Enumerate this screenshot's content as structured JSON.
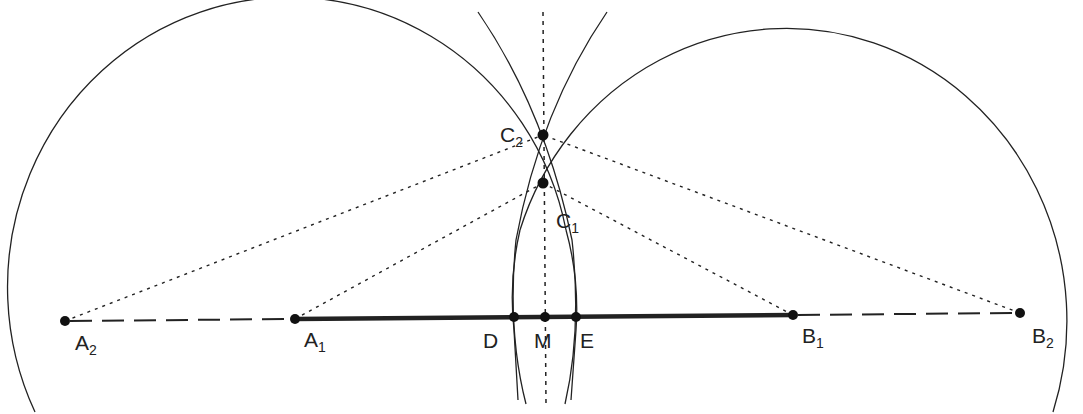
{
  "diagram": {
    "title": "",
    "colors": {
      "ink": "#222222",
      "background": "#ffffff"
    },
    "points": {
      "A2": {
        "label": "A",
        "sub": "2",
        "x": 65,
        "y": 321
      },
      "A1": {
        "label": "A",
        "sub": "1",
        "x": 295,
        "y": 319
      },
      "D": {
        "label": "D",
        "sub": "",
        "x": 514,
        "y": 317
      },
      "M": {
        "label": "M",
        "sub": "",
        "x": 545,
        "y": 317
      },
      "E": {
        "label": "E",
        "sub": "",
        "x": 576,
        "y": 317
      },
      "B1": {
        "label": "B",
        "sub": "1",
        "x": 793,
        "y": 315
      },
      "B2": {
        "label": "B",
        "sub": "2",
        "x": 1020,
        "y": 313
      },
      "C2": {
        "label": "C",
        "sub": "2",
        "x": 543,
        "y": 135
      },
      "C1": {
        "label": "C",
        "sub": "1",
        "x": 543,
        "y": 183
      }
    },
    "segments": [
      {
        "from": "A1",
        "to": "B1",
        "style": "bold"
      },
      {
        "from": "A2",
        "to": "A1",
        "style": "dashed"
      },
      {
        "from": "B1",
        "to": "B2",
        "style": "dashed"
      },
      {
        "from": "A2",
        "to": "C2",
        "style": "dotted"
      },
      {
        "from": "B2",
        "to": "C2",
        "style": "dotted"
      },
      {
        "from": "A1",
        "to": "C1",
        "style": "dotted"
      },
      {
        "from": "B1",
        "to": "C1",
        "style": "dotted"
      },
      {
        "name": "perpendicular-bisector",
        "style": "dotted"
      }
    ],
    "circles": [
      {
        "center": "A1",
        "through": "C1"
      },
      {
        "center": "B1",
        "through": "C1"
      },
      {
        "center": "A2",
        "through": "C2"
      },
      {
        "center": "B2",
        "through": "C2"
      }
    ]
  }
}
